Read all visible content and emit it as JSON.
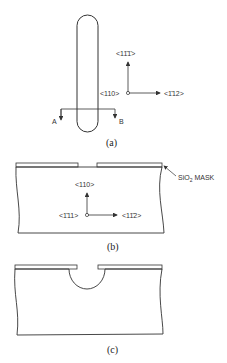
{
  "panel_a": {
    "caption": "(a)",
    "dir_up": "<11̄1̄>",
    "dir_origin": "<110>",
    "dir_right": "<1̄12>",
    "section_left": "A",
    "section_right": "B"
  },
  "panel_b": {
    "caption": "(b)",
    "dir_up": "<110>",
    "dir_origin": "<1̄11>",
    "dir_right": "<11̄2>",
    "mask_label": "SiO",
    "mask_sub": "2",
    "mask_suffix": " MASK"
  },
  "panel_c": {
    "caption": "(c)"
  },
  "colors": {
    "line": "#333333",
    "background": "#ffffff"
  }
}
